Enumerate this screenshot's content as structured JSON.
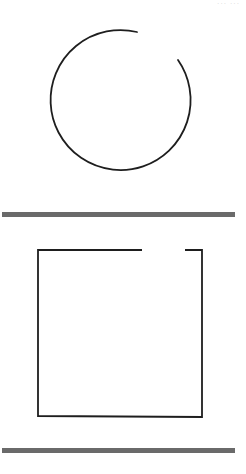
{
  "page": {
    "corner_text": "··· ···",
    "background": "#ffffff"
  },
  "figures": {
    "circle": {
      "label": "incomplete-circle",
      "center": [
        122,
        103
      ],
      "radius": 70,
      "gap_start": [
        178,
        60
      ],
      "gap_end": [
        137,
        32
      ],
      "stroke": "#1e1e1e"
    },
    "square": {
      "label": "incomplete-square",
      "top_left": [
        38,
        250
      ],
      "bottom_right": [
        202,
        417
      ],
      "gap_on_top_edge": [
        142,
        185
      ],
      "stroke": "#1e1e1e"
    }
  },
  "dividers": [
    {
      "y": 212,
      "color": "#6a6a6a"
    },
    {
      "y": 448,
      "color": "#6a6a6a"
    }
  ]
}
